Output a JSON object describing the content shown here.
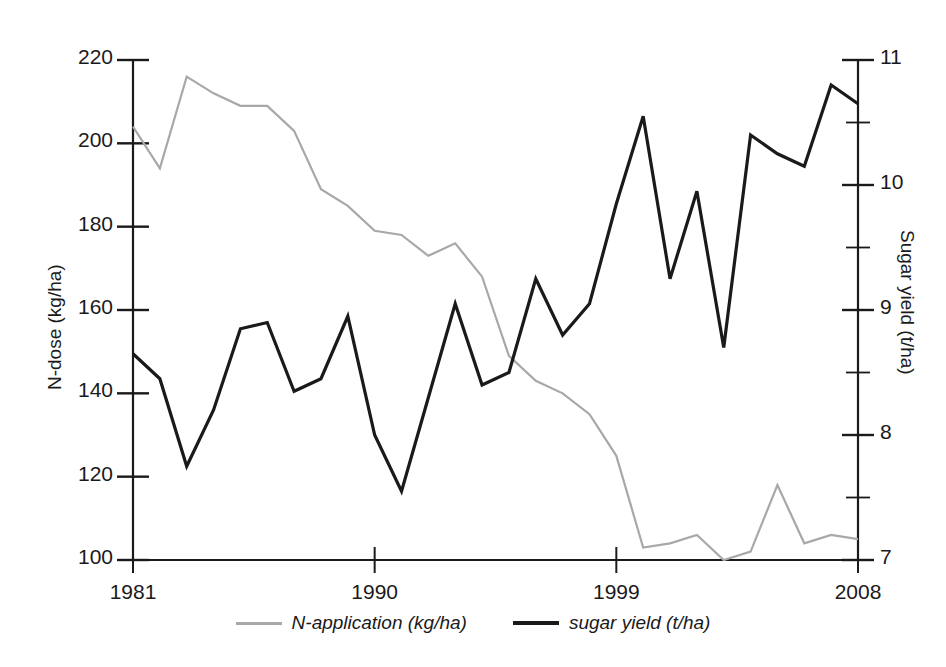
{
  "chart_data": {
    "type": "line",
    "title": "",
    "xlabel": "",
    "x": [
      1981,
      1982,
      1983,
      1984,
      1985,
      1986,
      1987,
      1988,
      1989,
      1990,
      1991,
      1992,
      1993,
      1994,
      1995,
      1996,
      1997,
      1998,
      1999,
      2000,
      2001,
      2002,
      2003,
      2004,
      2005,
      2006,
      2007,
      2008
    ],
    "xlim": [
      1981,
      2008
    ],
    "xticks": [
      1981,
      1990,
      1999,
      2008
    ],
    "xticklabels": [
      "1981",
      "1990",
      "1999",
      "2008"
    ],
    "grid": false,
    "legend_position": "bottom-center",
    "axes": [
      {
        "id": "left",
        "label": "N-dose (kg/ha)",
        "ylim": [
          100,
          220
        ],
        "yticks": [
          100,
          120,
          140,
          160,
          180,
          200,
          220
        ],
        "yticklabels": [
          "100",
          "120",
          "140",
          "160",
          "180",
          "200",
          "220"
        ],
        "minor_ticks": false
      },
      {
        "id": "right",
        "label": "Sugar yield (t/ha)",
        "ylim": [
          7,
          11
        ],
        "yticks": [
          7,
          8,
          9,
          10,
          11
        ],
        "yticklabels": [
          "7",
          "8",
          "9",
          "10",
          "11"
        ],
        "minor_ticks": [
          7.5,
          8.5,
          9.5,
          10.5
        ]
      }
    ],
    "series": [
      {
        "name": "N-application (kg/ha)",
        "legend_label": "N-application (kg/ha)",
        "axis": "left",
        "color": "#a8a8a8",
        "linewidth": 2.2,
        "values": [
          204,
          194,
          216,
          212,
          209,
          209,
          203,
          189,
          185,
          179,
          178,
          173,
          176,
          168,
          149,
          143,
          140,
          135,
          125,
          103,
          104,
          106,
          100,
          102,
          118,
          104,
          106,
          105
        ]
      },
      {
        "name": "sugar yield (t/ha)",
        "legend_label": "sugar yield (t/ha)",
        "axis": "right",
        "color": "#1a1a1a",
        "linewidth": 3.2,
        "values": [
          8.65,
          8.45,
          7.75,
          8.2,
          8.85,
          8.9,
          8.35,
          8.45,
          8.95,
          8.0,
          7.55,
          8.3,
          9.05,
          8.4,
          8.5,
          9.25,
          8.8,
          9.05,
          9.85,
          10.55,
          9.25,
          9.95,
          8.7,
          10.4,
          10.25,
          10.15,
          10.8,
          10.65
        ]
      }
    ]
  },
  "legend": {
    "items": [
      {
        "label": "N-application (kg/ha)",
        "style": "gray"
      },
      {
        "label": "sugar yield (t/ha)",
        "style": "black"
      }
    ]
  }
}
